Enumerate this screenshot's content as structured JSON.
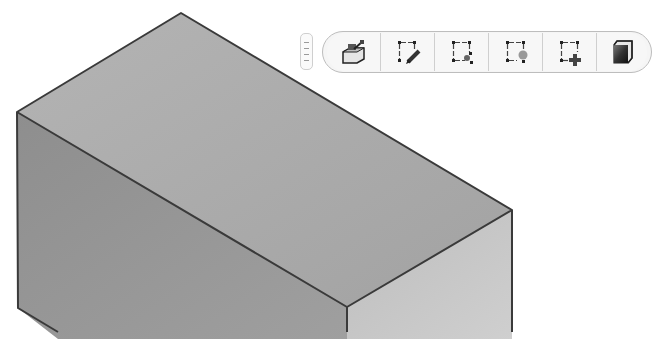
{
  "viewport": {
    "model": "isometric-block",
    "colors": {
      "top_face": "#a9a9a9",
      "left_face": "#959595",
      "right_face": "#c6c6c6",
      "edge": "#3a3a3a",
      "background": "#ffffff"
    }
  },
  "toolbar": {
    "grip_icon": "grip-handle-icon",
    "buttons": [
      {
        "id": "extrude",
        "icon": "extrude-sketch-icon"
      },
      {
        "id": "sketch-edit",
        "icon": "sketch-pencil-icon"
      },
      {
        "id": "sketch-point",
        "icon": "sketch-node-icon"
      },
      {
        "id": "sketch-circle",
        "icon": "sketch-circle-icon"
      },
      {
        "id": "sketch-add",
        "icon": "sketch-add-icon"
      },
      {
        "id": "shaded-view",
        "icon": "shaded-cube-icon"
      }
    ]
  }
}
